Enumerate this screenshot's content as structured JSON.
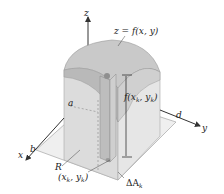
{
  "figure": {
    "colors": {
      "background": "#ffffff",
      "solid_side": "#d6d6d6",
      "solid_side_light": "#e4e4e4",
      "surface_top": "#c4c4c4",
      "surface_dark": "#a9a9a9",
      "column": "#bdbdbd",
      "axis": "#333333",
      "base_plane": "#ececec"
    },
    "axes": {
      "x_label": "x",
      "y_label": "y",
      "z_label": "z"
    },
    "labels": {
      "surface": "z = f(x, y)",
      "height": "f(x",
      "height_sub": "k",
      "height_mid": ", y",
      "height_sub2": "k",
      "height_end": ")",
      "region": "R",
      "point_open": "(x",
      "point_sub": "k",
      "point_mid": ", y",
      "point_sub2": "k",
      "point_end": ")",
      "area_delta": "ΔA",
      "area_sub": "k",
      "a": "a",
      "b": "b",
      "d": "d"
    }
  }
}
